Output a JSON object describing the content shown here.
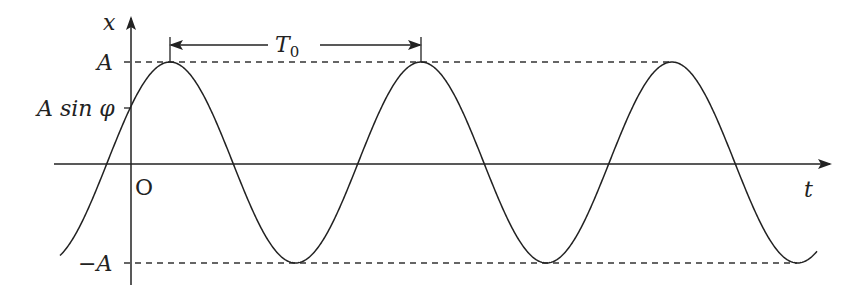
{
  "diagram": {
    "axes": {
      "x_axis_label": "t",
      "y_axis_label": "x",
      "origin_label": "O"
    },
    "y_ticks": {
      "amplitude": "A",
      "initial": "A sin φ",
      "neg_amplitude": "−A"
    },
    "period_label": "T",
    "period_subscript": "0",
    "colors": {
      "line": "#222222",
      "background": "#ffffff"
    }
  }
}
